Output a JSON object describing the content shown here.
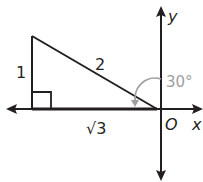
{
  "diagram": {
    "type": "right-triangle-on-coordinate-axes",
    "axes": {
      "x_label": "x",
      "y_label": "y",
      "origin_label": "O"
    },
    "triangle": {
      "side_vertical_label": "1",
      "hypotenuse_label": "2",
      "side_horizontal_label": "√3",
      "right_angle": true
    },
    "angle": {
      "label": "30°",
      "color": "#a0a0a0"
    },
    "colors": {
      "line": "#231f20",
      "background": "#ffffff"
    }
  }
}
